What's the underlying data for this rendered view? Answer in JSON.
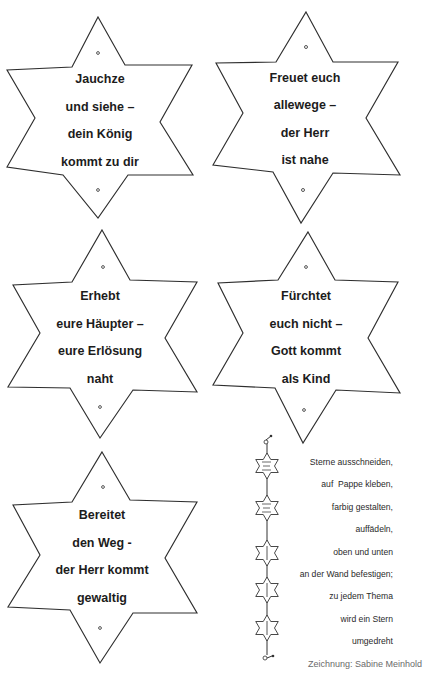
{
  "stars": [
    {
      "lines": [
        "Jauchze",
        "und siehe –",
        "dein König",
        "kommt zu dir"
      ]
    },
    {
      "lines": [
        "Freuet euch",
        "allewege –",
        "der Herr",
        "ist nahe"
      ]
    },
    {
      "lines": [
        "Erhebt",
        "eure Häupter –",
        "eure Erlösung",
        "naht"
      ]
    },
    {
      "lines": [
        "Fürchtet",
        "euch nicht –",
        "Gott kommt",
        "als Kind"
      ]
    },
    {
      "lines": [
        "Bereitet",
        "den Weg -",
        "der Herr kommt",
        "gewaltig"
      ]
    }
  ],
  "instructions": {
    "lines": [
      "Sterne ausschneiden,",
      "auf  Pappe kleben,",
      "farbig gestalten,",
      "auffädeln,",
      "oben und unten",
      "an der Wand befestigen;",
      "zu jedem Thema",
      "wird ein Stern",
      "umgedreht"
    ]
  },
  "credit": "Zeichnung: Sabine Meinhold",
  "garland": {
    "star_count": 5,
    "icon": "star-garland-icon"
  },
  "colors": {
    "line": "#2e2e2e",
    "text": "#1c1c1c",
    "credit": "#6a6a6a",
    "background": "#ffffff"
  }
}
